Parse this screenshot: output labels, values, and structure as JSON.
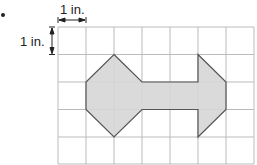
{
  "diagram": {
    "type": "grid-figure",
    "top_scale_label": "1 in.",
    "left_scale_label": "1 in.",
    "grid": {
      "columns": 7,
      "rows": 5,
      "cell_unit": "1 in."
    },
    "shape": {
      "description": "Shaded polygon on grid: octagon-like left end connected by a bar to an arrow-shaped right end",
      "fill": "#d6d6d6",
      "stroke": "#555555",
      "vertices_grid_units": [
        [
          2,
          1
        ],
        [
          3,
          2
        ],
        [
          5,
          2
        ],
        [
          5,
          1
        ],
        [
          6,
          2
        ],
        [
          6,
          3
        ],
        [
          5,
          4
        ],
        [
          5,
          3
        ],
        [
          3,
          3
        ],
        [
          2,
          4
        ],
        [
          1,
          3
        ],
        [
          1,
          2
        ]
      ]
    },
    "colors": {
      "grid_line": "#bbbbbb",
      "text": "#222222"
    }
  }
}
